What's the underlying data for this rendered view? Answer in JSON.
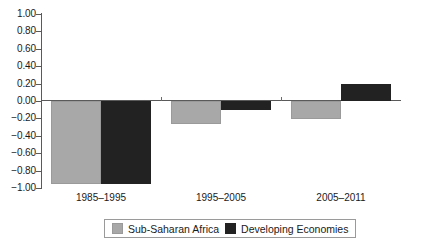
{
  "chart_data": {
    "type": "bar",
    "title": "",
    "subtitle": "",
    "xlabel": "",
    "ylabel": "",
    "categories": [
      "1985–1995",
      "1995–2005",
      "2005–2011"
    ],
    "series": [
      {
        "name": "Sub-Saharan Africa",
        "color": "#a8a8a8",
        "values": [
          -0.95,
          -0.27,
          -0.21
        ]
      },
      {
        "name": "Developing Economies",
        "color": "#222222",
        "values": [
          -0.95,
          -0.1,
          0.2
        ]
      }
    ],
    "ylim": [
      -1.0,
      1.0
    ],
    "ytick_step": 0.2,
    "ytick_labels": [
      "1.00",
      "0.80",
      "0.60",
      "0.40",
      "0.20",
      "0.00",
      "−0.20",
      "−0.40",
      "−0.60",
      "−0.80",
      "−1.00"
    ],
    "ytick_values": [
      1.0,
      0.8,
      0.6,
      0.4,
      0.2,
      0.0,
      -0.2,
      -0.4,
      -0.6,
      -0.8,
      -1.0
    ],
    "grid": false,
    "zero_line": true,
    "legend_position": "bottom",
    "legend": [
      "Sub-Saharan Africa",
      "Developing Economies"
    ]
  }
}
